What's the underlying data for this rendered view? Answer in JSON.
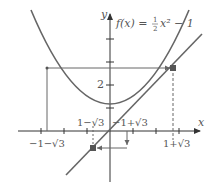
{
  "diagram": {
    "function_label": {
      "lhs": "f(x) =",
      "frac_num": "1",
      "frac_den": "2",
      "rest": "x² − 1"
    },
    "axes": {
      "x_label": "x",
      "y_label": "y",
      "y_tick_label": "2"
    },
    "x_labels": {
      "neg_one_minus_sqrt3": "−1−√3",
      "one_minus_sqrt3": "1−√3",
      "neg_one_plus_sqrt3": "−1+√3",
      "one_plus_sqrt3": "1+√3"
    },
    "points": [
      {
        "name": "fixed point",
        "x": "1+√3",
        "y": "1+√3"
      },
      {
        "name": "fixed point",
        "x": "1−√3",
        "y": "1−√3"
      }
    ],
    "curves": [
      "y = 1/2 x^2 - 1",
      "y = x"
    ],
    "colors": {
      "curve": "#666666",
      "axis": "#333333",
      "point": "#555555"
    }
  }
}
